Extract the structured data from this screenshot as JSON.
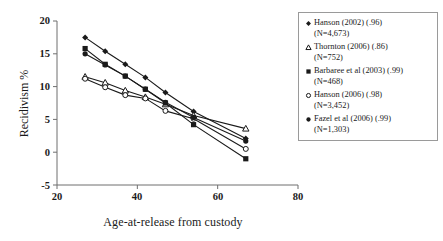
{
  "chart_data": {
    "type": "line",
    "title": "",
    "xlabel": "Age-at-release from custody",
    "ylabel": "Recidivism %",
    "xlim": [
      20,
      80
    ],
    "ylim": [
      -5,
      20
    ],
    "xticks": [
      20,
      40,
      60,
      80
    ],
    "yticks": [
      -5,
      0,
      5,
      10,
      15,
      20
    ],
    "grid": false,
    "legend_position": "right",
    "series": [
      {
        "name": "Hanson (2002) (.96)",
        "detail": "(N=4,673)",
        "marker": "filled-diamond",
        "label": "Hanson (2002) (.96)\n(N=4,673)",
        "x": [
          27,
          32,
          37,
          42,
          47,
          54,
          67
        ],
        "y": [
          17.5,
          15.4,
          13.4,
          11.4,
          9.1,
          6.2,
          2.1
        ]
      },
      {
        "name": "Thornton (2006) (.86)",
        "detail": "(N=752)",
        "marker": "open-triangle",
        "label": "Thornton (2006) (.86)\n(N=752)",
        "x": [
          27,
          32,
          37,
          42,
          47,
          54,
          67
        ],
        "y": [
          11.5,
          10.6,
          9.4,
          8.4,
          7.3,
          5.6,
          3.6
        ]
      },
      {
        "name": "Barbaree et al (2003) (.99)",
        "detail": "(N=468)",
        "marker": "filled-square",
        "label": "Barbaree et al (2003) (.99)\n(N=468)",
        "x": [
          27,
          32,
          37,
          42,
          47,
          54,
          67
        ],
        "y": [
          15.8,
          13.4,
          11.6,
          9.6,
          7.5,
          4.2,
          -1.0
        ]
      },
      {
        "name": "Hanson (2006) (.98)",
        "detail": "(N=3,452)",
        "marker": "open-circle",
        "label": "Hanson (2006) (.98)\n(N=3,452)",
        "x": [
          27,
          32,
          37,
          42,
          47,
          54,
          67
        ],
        "y": [
          11.2,
          9.9,
          8.7,
          8.2,
          6.3,
          5.1,
          0.5
        ]
      },
      {
        "name": "Fazel et al (2006) (.99)",
        "detail": "(N=1,303)",
        "marker": "filled-circle",
        "label": "Fazel et al (2006) (.99)\n(N=1,303)",
        "x": [
          27,
          32,
          37,
          42,
          47,
          54,
          67
        ],
        "y": [
          15.0,
          13.3,
          11.6,
          9.6,
          7.6,
          5.3,
          1.7
        ]
      }
    ]
  },
  "axes": {
    "y_title": "Recidivism %",
    "x_title": "Age-at-release from custody",
    "y_tick_labels": [
      "20",
      "15",
      "10",
      "5",
      "0",
      "-5"
    ],
    "x_tick_labels": [
      "20",
      "40",
      "60",
      "80"
    ]
  },
  "legend": {
    "items": [
      {
        "marker": "filled-diamond",
        "text": "Hanson (2002) (.96)\n(N=4,673)"
      },
      {
        "marker": "open-triangle",
        "text": "Thornton (2006) (.86)\n(N=752)"
      },
      {
        "marker": "filled-square",
        "text": "Barbaree et al (2003) (.99)\n(N=468)"
      },
      {
        "marker": "open-circle",
        "text": "Hanson (2006) (.98)\n(N=3,452)"
      },
      {
        "marker": "filled-circle",
        "text": "Fazel et al (2006) (.99)\n(N=1,303)"
      }
    ]
  },
  "colors": {
    "line": "#1a1a1a",
    "axis": "#6f6f6f",
    "legend_border": "#9a9a9a",
    "background": "#ffffff"
  }
}
